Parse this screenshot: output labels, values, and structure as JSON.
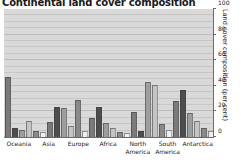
{
  "chart_data": {
    "type": "bar",
    "title": "Continental land cover composition",
    "xlabel": "",
    "ylabel": "Land cover composition (per cent)",
    "ylim": [
      0,
      100
    ],
    "yticks": [
      0,
      20,
      40,
      60,
      80,
      100
    ],
    "grid": true,
    "legend": "none",
    "axis_position": "right",
    "categories": [
      "Oceania",
      "Asia",
      "Europe",
      "Africa",
      "North America",
      "South America",
      "Antarctica"
    ],
    "category_lines": [
      [
        "Oceania"
      ],
      [
        "Asia"
      ],
      [
        "Europe"
      ],
      [
        "Africa"
      ],
      [
        "North",
        "America"
      ],
      [
        "South",
        "America"
      ],
      [
        "Antarctica"
      ]
    ],
    "series": [
      {
        "name": "Series 1",
        "color": "#7a7a7a",
        "values": [
          46,
          11,
          14,
          19,
          27,
          12,
          0
        ]
      },
      {
        "name": "Series 2",
        "color": "#4d4d4d",
        "values": [
          6,
          23,
          23,
          4,
          36,
          55,
          0
        ]
      },
      {
        "name": "Series 3",
        "color": "#9e9e9e",
        "values": [
          5,
          22,
          10,
          42,
          18,
          14,
          0
        ]
      },
      {
        "name": "Series 4",
        "color": "#c4c4c4",
        "values": [
          12,
          8,
          6,
          40,
          12,
          5,
          0
        ]
      },
      {
        "name": "Series 5",
        "color": "#8a8a8a",
        "values": [
          4,
          28,
          3,
          9,
          6,
          9,
          0
        ]
      },
      {
        "name": "Series 6",
        "color": "#efefef",
        "values": [
          3,
          4,
          2,
          5,
          4,
          2,
          99
        ]
      }
    ]
  }
}
